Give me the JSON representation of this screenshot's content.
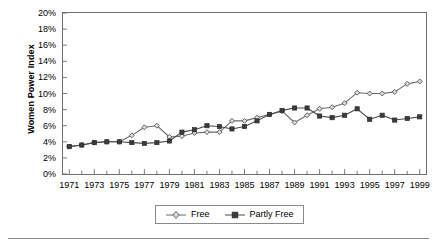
{
  "chart_data": {
    "type": "line",
    "title": "",
    "subtitle": "",
    "xlabel": "",
    "ylabel": "Women Power Index",
    "x": [
      1971,
      1972,
      1973,
      1974,
      1975,
      1976,
      1977,
      1978,
      1979,
      1980,
      1981,
      1982,
      1983,
      1984,
      1985,
      1986,
      1987,
      1988,
      1989,
      1990,
      1991,
      1992,
      1993,
      1994,
      1995,
      1996,
      1997,
      1998,
      1999
    ],
    "xlim": [
      1970.5,
      1999.5
    ],
    "ylim": [
      0,
      20
    ],
    "ytick_values": [
      0,
      2,
      4,
      6,
      8,
      10,
      12,
      14,
      16,
      18,
      20
    ],
    "ytick_labels": [
      "0%",
      "2%",
      "4%",
      "6%",
      "8%",
      "10%",
      "12%",
      "14%",
      "16%",
      "18%",
      "20%"
    ],
    "xtick_labels": [
      "1971",
      "1973",
      "1975",
      "1977",
      "1979",
      "1981",
      "1983",
      "1985",
      "1987",
      "1989",
      "1991",
      "1993",
      "1995",
      "1997",
      "1999"
    ],
    "xtick_values": [
      1971,
      1973,
      1975,
      1977,
      1979,
      1981,
      1983,
      1985,
      1987,
      1989,
      1991,
      1993,
      1995,
      1997,
      1999
    ],
    "minor_xticks_every": 1,
    "grid": false,
    "legend_position": "bottom-center",
    "series": [
      {
        "name": "Free",
        "marker": "diamond",
        "color": "#6b6b6b",
        "values": [
          3.4,
          3.6,
          3.9,
          4.0,
          4.0,
          4.8,
          5.8,
          6.0,
          4.6,
          4.7,
          5.1,
          5.2,
          5.2,
          6.6,
          6.6,
          7.0,
          7.4,
          7.8,
          6.4,
          7.3,
          8.1,
          8.3,
          8.8,
          10.1,
          10.0,
          10.0,
          10.2,
          11.2,
          11.5
        ]
      },
      {
        "name": "Partly Free",
        "marker": "square",
        "color": "#4a4a4a",
        "values": [
          3.4,
          3.6,
          3.9,
          4.0,
          4.0,
          3.9,
          3.8,
          3.9,
          4.1,
          5.2,
          5.5,
          6.0,
          5.9,
          5.6,
          5.9,
          6.6,
          7.4,
          7.9,
          8.2,
          8.2,
          7.2,
          7.0,
          7.3,
          8.1,
          6.8,
          7.3,
          6.7,
          6.9,
          7.1
        ]
      }
    ],
    "series_final_values": {
      "Free": 11.8,
      "Partly Free": 8.3
    }
  },
  "legend": {
    "entries": [
      {
        "label": "Free"
      },
      {
        "label": "Partly Free"
      }
    ]
  }
}
